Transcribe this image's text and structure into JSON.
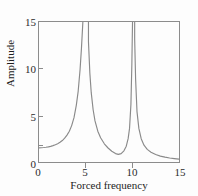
{
  "chart_data": {
    "type": "line",
    "title": "",
    "xlabel": "Forced frequency",
    "ylabel": "Amplitude",
    "xlim": [
      0,
      15
    ],
    "ylim": [
      0,
      15
    ],
    "xticks": [
      0,
      5,
      10,
      15
    ],
    "yticks": [
      0,
      5,
      10,
      15
    ],
    "xtick_labels": [
      "0",
      "5",
      "10",
      "15"
    ],
    "ytick_labels": [
      "0",
      "5",
      "10",
      "15"
    ],
    "grid": false,
    "legend": null,
    "line_color": "#8a8a8a",
    "axis_color": "#8c8c8c",
    "background_color": "#fdfdfd",
    "resonance_frequencies": [
      5.0,
      10.1
    ],
    "antiresonance_frequency": 8.5,
    "antiresonance_value": 0.8,
    "value_at_zero": 1.5,
    "value_at_max_x": 0.2,
    "series": [
      {
        "name": "Amplitude response",
        "x": [
          0.0,
          0.25,
          0.5,
          0.75,
          1.0,
          1.25,
          1.5,
          1.75,
          2.0,
          2.25,
          2.5,
          2.75,
          3.0,
          3.25,
          3.5,
          3.75,
          4.0,
          4.2,
          4.4,
          4.55,
          4.7,
          4.8,
          4.88,
          4.94,
          4.97,
          5.03,
          5.06,
          5.12,
          5.2,
          5.3,
          5.45,
          5.6,
          5.8,
          6.0,
          6.3,
          6.6,
          7.0,
          7.4,
          7.8,
          8.2,
          8.5,
          8.8,
          9.1,
          9.35,
          9.55,
          9.7,
          9.85,
          9.95,
          10.02,
          10.06,
          10.14,
          10.18,
          10.25,
          10.35,
          10.5,
          10.7,
          10.95,
          11.25,
          11.6,
          12.0,
          12.5,
          13.0,
          13.5,
          14.0,
          14.5,
          15.0
        ],
        "y": [
          1.52,
          1.53,
          1.55,
          1.58,
          1.62,
          1.68,
          1.75,
          1.84,
          1.96,
          2.11,
          2.3,
          2.55,
          2.88,
          3.3,
          3.9,
          4.75,
          6.1,
          7.6,
          9.9,
          12.2,
          15.0,
          15.0,
          15.0,
          15.0,
          15.0,
          15.0,
          15.0,
          15.0,
          15.0,
          12.9,
          9.5,
          7.4,
          5.6,
          4.4,
          3.3,
          2.6,
          1.95,
          1.5,
          1.15,
          0.9,
          0.82,
          0.9,
          1.2,
          1.7,
          2.5,
          3.6,
          6.2,
          10.5,
          15.0,
          15.0,
          15.0,
          15.0,
          13.2,
          8.9,
          5.4,
          3.6,
          2.5,
          1.8,
          1.35,
          1.05,
          0.8,
          0.63,
          0.52,
          0.43,
          0.36,
          0.3
        ]
      }
    ]
  },
  "axis_titles": {
    "x": "Forced frequency",
    "y": "Amplitude"
  }
}
